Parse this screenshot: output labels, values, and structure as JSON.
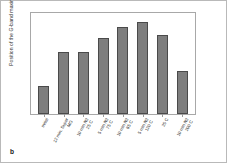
{
  "figure": {
    "panel_label": "b",
    "border_color": "#b9b9b9",
    "bar_color": "#7e7e7e",
    "bar_edge_color": "#4a4a4a",
    "axis_color": "#a8a8a8",
    "text_color": "#2b2b2b"
  },
  "chart_data": {
    "type": "bar",
    "title": "",
    "xlabel": "",
    "ylabel": "Position of the G-band maximum (nm)",
    "ylim": [
      610,
      626
    ],
    "yticks": [
      610,
      614,
      618,
      622,
      626
    ],
    "ytick_labels": [
      "610",
      "614",
      "618",
      "622",
      "626"
    ],
    "grid": false,
    "legend": null,
    "categories": [
      "initial",
      "12 min. Super\nMG",
      "10 min N2\n25 C",
      "5 min N2\n75 C",
      "10 min N2\n85 C",
      "5 min N2\n120 C",
      "25 C",
      "10 min N2\n200 C"
    ],
    "values": [
      614.3,
      619.7,
      619.7,
      621.8,
      623.5,
      624.3,
      622.2,
      616.7
    ]
  }
}
